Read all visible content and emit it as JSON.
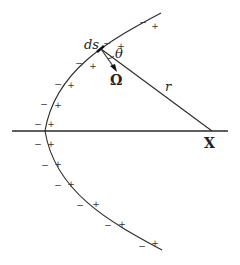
{
  "diagram": {
    "labels": {
      "ds": "ds",
      "theta": "θ",
      "omega": "Ω",
      "r": "r",
      "x": "X"
    },
    "colors": {
      "line": "#2a2a2a",
      "background": "#ffffff"
    },
    "signs": [
      {
        "neg": "−",
        "pos": "+",
        "nx": 143,
        "ny": 22,
        "px": 155,
        "py": 26
      },
      {
        "neg": "−",
        "pos": "+",
        "nx": 107,
        "ny": 43,
        "px": 121,
        "py": 46
      },
      {
        "neg": "−",
        "pos": "+",
        "nx": 79,
        "ny": 63,
        "px": 93,
        "py": 66
      },
      {
        "neg": "−",
        "pos": "+",
        "nx": 58,
        "ny": 84,
        "px": 71,
        "py": 85
      },
      {
        "neg": "−",
        "pos": "+",
        "nx": 44,
        "ny": 104,
        "px": 58,
        "py": 105
      },
      {
        "neg": "−",
        "pos": "+",
        "nx": 38,
        "ny": 124,
        "px": 51,
        "py": 124
      },
      {
        "neg": "−",
        "pos": "+",
        "nx": 38,
        "ny": 144,
        "px": 51,
        "py": 144
      },
      {
        "neg": "−",
        "pos": "+",
        "nx": 45,
        "ny": 165,
        "px": 58,
        "py": 164
      },
      {
        "neg": "−",
        "pos": "+",
        "nx": 58,
        "ny": 185,
        "px": 71,
        "py": 184
      },
      {
        "neg": "−",
        "pos": "+",
        "nx": 80,
        "ny": 205,
        "px": 96,
        "py": 204
      },
      {
        "neg": "−",
        "pos": "+",
        "nx": 108,
        "ny": 225,
        "px": 122,
        "py": 224
      },
      {
        "neg": "−",
        "pos": "+",
        "nx": 142,
        "ny": 246,
        "px": 155,
        "py": 243
      }
    ]
  }
}
